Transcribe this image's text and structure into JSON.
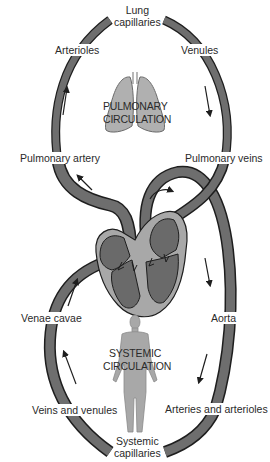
{
  "diagram": {
    "type": "circulatory-system",
    "colors": {
      "vessel_fill": "#6e6e6e",
      "vessel_outline": "#1e1e1e",
      "heart_dark": "#6a6a6a",
      "heart_light": "#a8a8a8",
      "organ_fill": "#b0b0b0",
      "arrow": "#1e1e1e",
      "text": "#2a2a2a",
      "background": "#ffffff"
    },
    "pulmonary": {
      "title_line1": "PULMONARY",
      "title_line2": "CIRCULATION",
      "labels": {
        "capillaries_line1": "Lung",
        "capillaries_line2": "capillaries",
        "arterioles": "Arterioles",
        "venules": "Venules",
        "artery": "Pulmonary artery",
        "veins": "Pulmonary veins"
      }
    },
    "systemic": {
      "title_line1": "SYSTEMIC",
      "title_line2": "CIRCULATION",
      "labels": {
        "venae_cavae": "Venae cavae",
        "aorta": "Aorta",
        "veins_venules": "Veins and venules",
        "arteries_arterioles": "Arteries and arterioles",
        "capillaries_line1": "Systemic",
        "capillaries_line2": "capillaries"
      }
    },
    "flow_arrows": [
      {
        "location": "left-pulmonary",
        "direction": "up"
      },
      {
        "location": "right-pulmonary",
        "direction": "down"
      },
      {
        "location": "pulmonary-artery-exit",
        "direction": "up-left"
      },
      {
        "location": "aortic-arch",
        "direction": "right"
      },
      {
        "location": "right-systemic-upper",
        "direction": "down"
      },
      {
        "location": "right-systemic-lower",
        "direction": "down"
      },
      {
        "location": "left-systemic-upper",
        "direction": "up"
      },
      {
        "location": "left-systemic-lower",
        "direction": "up"
      }
    ]
  }
}
